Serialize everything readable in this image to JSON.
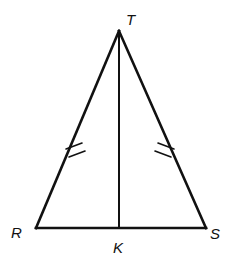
{
  "figure": {
    "kind": "geometry-diagram",
    "shape": "isosceles-triangle-with-altitude",
    "background_color": "#ffffff",
    "stroke_color": "#111111",
    "width": 240,
    "height": 270
  },
  "labels": {
    "apex": "T",
    "base_left": "R",
    "base_right": "S",
    "foot": "K"
  },
  "points": {
    "T": {
      "x": 119,
      "y": 31
    },
    "R": {
      "x": 36,
      "y": 228
    },
    "S": {
      "x": 206,
      "y": 228
    },
    "K": {
      "x": 119,
      "y": 228
    }
  },
  "label_positions": {
    "T": {
      "x": 126,
      "y": 25
    },
    "R": {
      "x": 11,
      "y": 238
    },
    "S": {
      "x": 210,
      "y": 239
    },
    "K": {
      "x": 113,
      "y": 253
    }
  },
  "segments": [
    {
      "name": "RT",
      "from": "R",
      "to": "T",
      "stroke_width": 2.6
    },
    {
      "name": "TS",
      "from": "T",
      "to": "S",
      "stroke_width": 2.6
    },
    {
      "name": "RS",
      "from": "R",
      "to": "S",
      "stroke_width": 2.6
    },
    {
      "name": "TK",
      "from": "T",
      "to": "K",
      "stroke_width": 2.0
    }
  ],
  "congruence_marks": {
    "count_per_side": 2,
    "sides": [
      "RT",
      "TS"
    ],
    "stroke_width": 1.6,
    "left": [
      {
        "x1": 66,
        "y1": 149,
        "x2": 82,
        "y2": 143
      },
      {
        "x1": 69,
        "y1": 157,
        "x2": 85,
        "y2": 151
      }
    ],
    "right": [
      {
        "x1": 158,
        "y1": 143,
        "x2": 174,
        "y2": 149
      },
      {
        "x1": 155,
        "y1": 151,
        "x2": 171,
        "y2": 157
      }
    ]
  }
}
